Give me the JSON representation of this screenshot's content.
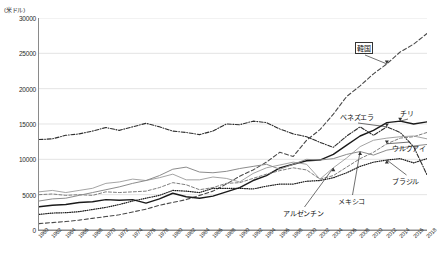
{
  "axis_unit_label": "(米ドル)",
  "chart_data": {
    "type": "line",
    "title": "",
    "subtitle": "",
    "xlabel": "",
    "ylabel": "(米ドル)",
    "xlim": [
      1960,
      2018
    ],
    "ylim": [
      0,
      30000
    ],
    "grid": true,
    "legend_position": "inline-annotations",
    "yticks": [
      0,
      5000,
      10000,
      15000,
      20000,
      25000,
      30000
    ],
    "ytick_labels": [
      "0",
      "5000",
      "10000",
      "15000",
      "20000",
      "25000",
      "30000"
    ],
    "x": [
      1960,
      1962,
      1964,
      1966,
      1968,
      1970,
      1972,
      1974,
      1976,
      1978,
      1980,
      1982,
      1984,
      1986,
      1988,
      1990,
      1992,
      1994,
      1996,
      1998,
      2000,
      2002,
      2004,
      2006,
      2008,
      2010,
      2012,
      2014,
      2016,
      2018
    ],
    "xtick_labels": [
      "1960",
      "1962",
      "1964",
      "1966",
      "1968",
      "1970",
      "1972",
      "1974",
      "1976",
      "1978",
      "1980",
      "1982",
      "1984",
      "1986",
      "1988",
      "1990",
      "1992",
      "1994",
      "1996",
      "1998",
      "2000",
      "2002",
      "2004",
      "2006",
      "2008",
      "2010",
      "2012",
      "2014",
      "2016",
      "2018"
    ],
    "series": [
      {
        "name": "韓国",
        "label": "韓国",
        "style": "dashed",
        "color": "#4a4a4a",
        "width": 1.1,
        "values": [
          900,
          1050,
          1200,
          1400,
          1650,
          1900,
          2150,
          2550,
          2950,
          3500,
          3900,
          4300,
          4900,
          5500,
          6500,
          7600,
          8500,
          9600,
          11000,
          10400,
          12700,
          14200,
          16400,
          18900,
          20400,
          22100,
          23500,
          25200,
          26300,
          27800
        ]
      },
      {
        "name": "ベネズエラ",
        "label": "ベネズエラ",
        "style": "dashdot",
        "color": "#2e2e2e",
        "width": 1.1,
        "values": [
          12800,
          12900,
          13400,
          13600,
          14000,
          14500,
          14100,
          14600,
          15100,
          14600,
          14000,
          13800,
          13500,
          14000,
          15000,
          14900,
          15400,
          15200,
          14300,
          13600,
          13200,
          12400,
          11700,
          13300,
          14600,
          13400,
          14600,
          13800,
          11800,
          7800
        ]
      },
      {
        "name": "チリ",
        "label": "チリ",
        "style": "solid",
        "color": "#1a1a1a",
        "width": 1.4,
        "values": [
          3300,
          3500,
          3600,
          3900,
          4000,
          4300,
          4200,
          4300,
          3800,
          4400,
          5200,
          4700,
          4500,
          4800,
          5400,
          6000,
          7000,
          7700,
          8800,
          9300,
          9800,
          9900,
          10700,
          12000,
          13300,
          14100,
          15200,
          15400,
          15000,
          15300
        ]
      },
      {
        "name": "ウルグアイ",
        "label": "ウルグアイ",
        "style": "dashed-thin",
        "color": "#6f6f6f",
        "width": 0.9,
        "values": [
          5000,
          5100,
          4900,
          5000,
          4900,
          5400,
          5300,
          5400,
          5500,
          6000,
          6700,
          6400,
          5700,
          6000,
          6600,
          6700,
          7300,
          7900,
          8400,
          8800,
          8500,
          7200,
          7700,
          8900,
          10100,
          11000,
          12200,
          13000,
          13200,
          13800
        ]
      },
      {
        "name": "ブラジル",
        "label": "ブラジル",
        "style": "dotted",
        "color": "#1a1a1a",
        "width": 1.2,
        "values": [
          2200,
          2400,
          2450,
          2600,
          2900,
          3200,
          3600,
          4100,
          4500,
          4900,
          5600,
          5500,
          5300,
          5900,
          5900,
          5900,
          5800,
          6200,
          6500,
          6500,
          6900,
          7000,
          7400,
          8100,
          9000,
          9600,
          9900,
          10100,
          9500,
          10100
        ]
      },
      {
        "name": "アルゼンチン",
        "label": "アルゼンチン",
        "style": "solid-thin",
        "color": "#9a9a9a",
        "width": 0.9,
        "values": [
          5400,
          5600,
          5300,
          5600,
          5900,
          6600,
          6800,
          7200,
          7000,
          7400,
          7900,
          7100,
          7100,
          7500,
          7300,
          6800,
          8000,
          8800,
          9200,
          9600,
          9300,
          7200,
          8800,
          10200,
          11800,
          12700,
          13000,
          13200,
          13300,
          12900
        ]
      },
      {
        "name": "メキシコ",
        "label": "メキシコ",
        "style": "solid-gray",
        "color": "#8c8c8c",
        "width": 1.0,
        "values": [
          4100,
          4400,
          4500,
          4900,
          5300,
          5700,
          6100,
          6600,
          7000,
          7700,
          8600,
          8900,
          8200,
          8100,
          8300,
          8700,
          9000,
          9300,
          8600,
          9300,
          10000,
          9900,
          10100,
          10700,
          11100,
          10600,
          11300,
          11600,
          11900,
          12100
        ]
      }
    ],
    "annotations": [
      {
        "text": "韓国",
        "boxed": true,
        "target_series": "韓国"
      },
      {
        "text": "ベネズエラ",
        "boxed": false,
        "target_series": "ベネズエラ"
      },
      {
        "text": "チリ",
        "boxed": false,
        "target_series": "チリ"
      },
      {
        "text": "ウルグアイ",
        "boxed": false,
        "target_series": "ウルグアイ"
      },
      {
        "text": "ブラジル",
        "boxed": false,
        "target_series": "ブラジル"
      },
      {
        "text": "アルゼンチン",
        "boxed": false,
        "target_series": "アルゼンチン"
      },
      {
        "text": "メキシコ",
        "boxed": false,
        "target_series": "メキシコ"
      }
    ]
  }
}
